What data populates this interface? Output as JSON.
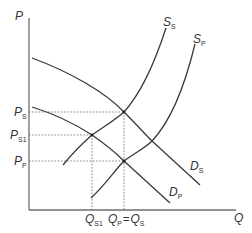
{
  "diagram": {
    "type": "supply-demand",
    "axes": {
      "y_label": "P",
      "x_label": "Q"
    },
    "curves": [
      {
        "id": "demand_s",
        "label_main": "D",
        "label_sub": "S"
      },
      {
        "id": "demand_p",
        "label_main": "D",
        "label_sub": "P"
      },
      {
        "id": "supply_s",
        "label_main": "S",
        "label_sub": "S"
      },
      {
        "id": "supply_p",
        "label_main": "S",
        "label_sub": "P"
      }
    ],
    "price_levels": [
      {
        "id": "p_s",
        "label_main": "P",
        "label_sub": "S"
      },
      {
        "id": "p_s1",
        "label_main": "P",
        "label_sub": "S1"
      },
      {
        "id": "p_p",
        "label_main": "P",
        "label_sub": "P"
      }
    ],
    "quantity_levels": [
      {
        "id": "q_s1",
        "label_main": "Q",
        "label_sub": "S1"
      },
      {
        "id": "q_p_eq_q_s",
        "left_main": "Q",
        "left_sub": "P",
        "equals": "=",
        "right_main": "Q",
        "right_sub": "S"
      }
    ],
    "colors": {
      "curve": "#3a3a3a",
      "axis": "#6e6e6e",
      "guide": "#7a7a7a",
      "text": "#333333"
    }
  }
}
